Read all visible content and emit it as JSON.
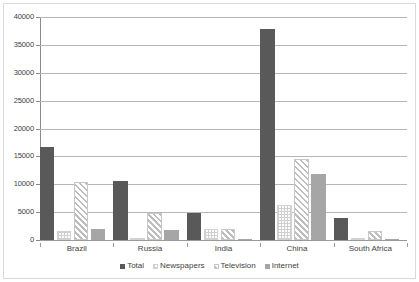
{
  "chart_data": {
    "type": "bar",
    "title": "",
    "subtitle": "",
    "xlabel": "",
    "ylabel": "",
    "grid": true,
    "legend_position": "bottom",
    "categories": [
      "Brazil",
      "Russia",
      "India",
      "China",
      "South Africa"
    ],
    "ylim": [
      0,
      40000
    ],
    "ytick_labels": [
      "40000",
      "35000",
      "30000",
      "25000",
      "20000",
      "15000",
      "10000",
      "5000",
      "0"
    ],
    "ytick_values": [
      40000,
      35000,
      30000,
      25000,
      20000,
      15000,
      10000,
      5000,
      0
    ],
    "ytick_step": 5000,
    "series": [
      {
        "name": "Total",
        "color": "#595959",
        "fill": "solid-dark-gray",
        "values": [
          16600,
          10500,
          4800,
          37800,
          3950
        ]
      },
      {
        "name": "Newspapers",
        "color": "#e8e8e8",
        "fill": "fine-dotted-light",
        "values": [
          1600,
          150,
          1950,
          6350,
          400
        ]
      },
      {
        "name": "Television",
        "color": "#c8c8c8",
        "fill": "diagonal-hatch",
        "values": [
          10400,
          4900,
          1950,
          14550,
          1650
        ]
      },
      {
        "name": "Internet",
        "color": "#a6a6a6",
        "fill": "solid-medium-gray",
        "values": [
          2000,
          1800,
          150,
          11800,
          60
        ]
      }
    ]
  }
}
